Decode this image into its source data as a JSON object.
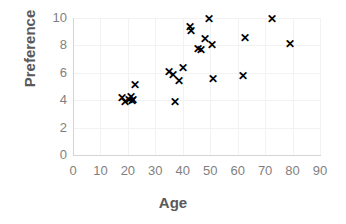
{
  "chart_data": {
    "type": "scatter",
    "title": "",
    "xlabel": "Age",
    "ylabel": "Preference",
    "xlim": [
      0,
      90
    ],
    "ylim": [
      0,
      10
    ],
    "xticks": [
      "0",
      "10",
      "20",
      "30",
      "40",
      "50",
      "60",
      "70",
      "80",
      "90"
    ],
    "yticks": [
      "0",
      "2",
      "4",
      "6",
      "8",
      "10"
    ],
    "xtick_values": [
      0,
      10,
      20,
      30,
      40,
      50,
      60,
      70,
      80,
      90
    ],
    "ytick_values": [
      0,
      2,
      4,
      6,
      8,
      10
    ],
    "grid": true,
    "legend": null,
    "marker": "x",
    "marker_color": "#000000",
    "series": [
      {
        "name": "Preference by Age",
        "points": [
          [
            18.0,
            4.1
          ],
          [
            19.0,
            3.8
          ],
          [
            20.5,
            4.0
          ],
          [
            21.0,
            4.2
          ],
          [
            21.5,
            3.9
          ],
          [
            22.0,
            4.0
          ],
          [
            22.5,
            5.1
          ],
          [
            35.0,
            6.0
          ],
          [
            36.5,
            5.8
          ],
          [
            37.0,
            3.8
          ],
          [
            38.5,
            5.4
          ],
          [
            40.0,
            6.3
          ],
          [
            42.5,
            9.3
          ],
          [
            43.0,
            9.0
          ],
          [
            45.5,
            7.7
          ],
          [
            46.5,
            7.6
          ],
          [
            48.0,
            8.4
          ],
          [
            49.5,
            9.9
          ],
          [
            50.5,
            8.0
          ],
          [
            51.0,
            5.5
          ],
          [
            62.0,
            5.7
          ],
          [
            62.5,
            8.5
          ],
          [
            72.5,
            9.9
          ],
          [
            79.0,
            8.1
          ]
        ]
      }
    ]
  },
  "axis_titles": {
    "x": "Age",
    "y": "Preference"
  }
}
